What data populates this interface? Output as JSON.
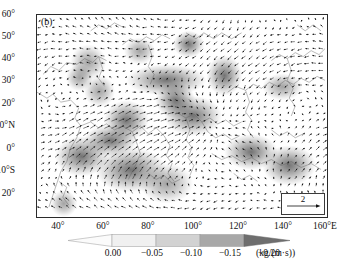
{
  "figure": {
    "panel_label": "(b)",
    "type": "map-vector-shaded"
  },
  "axes": {
    "y_ticks": [
      "60°",
      "50°",
      "40°",
      "30°",
      "20°",
      "10°N",
      "0°",
      "10°S",
      "20°"
    ],
    "x_ticks": [
      "40°",
      "60°",
      "80°",
      "100°",
      "120°",
      "140°",
      "160°E"
    ]
  },
  "vector_key": {
    "value": "2"
  },
  "colorbar": {
    "ticks": [
      "0.00",
      "−0.05",
      "−0.10",
      "−0.15",
      "−0.20"
    ],
    "unit": "(kg/(m·s))"
  },
  "chart_data": {
    "type": "heatmap",
    "title": "(b)",
    "xlabel": "",
    "ylabel": "",
    "xlim": [
      30,
      160
    ],
    "ylim": [
      -25,
      65
    ],
    "x_tick_values": [
      40,
      60,
      80,
      100,
      120,
      140,
      160
    ],
    "x_tick_labels": [
      "40°",
      "60°",
      "80°",
      "100°",
      "120°",
      "140°",
      "160°E"
    ],
    "y_tick_values": [
      60,
      50,
      40,
      30,
      20,
      10,
      0,
      -10,
      -20
    ],
    "y_tick_labels": [
      "60°",
      "50°",
      "40°",
      "30°",
      "20°",
      "10°N",
      "0°",
      "10°S",
      "20°"
    ],
    "grid": false,
    "legend_position": "bottom",
    "colorbar_levels": [
      0.0,
      -0.05,
      -0.1,
      -0.15,
      -0.2
    ],
    "colorbar_unit": "(kg/(m·s))",
    "colorbar_extend": "both",
    "vector_reference": 2,
    "vector_reference_unit": "",
    "shaded_variable": "moisture flux divergence",
    "shaded_blobs": [
      {
        "lon": 53,
        "lat": 44,
        "radius_lon": 8,
        "radius_lat": 8,
        "value": -0.13
      },
      {
        "lon": 49,
        "lat": 37,
        "radius_lon": 6,
        "radius_lat": 6,
        "value": -0.1
      },
      {
        "lon": 58,
        "lat": 31,
        "radius_lon": 7,
        "radius_lat": 7,
        "value": -0.09
      },
      {
        "lon": 76,
        "lat": 49,
        "radius_lon": 7,
        "radius_lat": 6,
        "value": -0.12
      },
      {
        "lon": 98,
        "lat": 52,
        "radius_lon": 7,
        "radius_lat": 6,
        "value": -0.16
      },
      {
        "lon": 88,
        "lat": 36,
        "radius_lon": 18,
        "radius_lat": 7,
        "value": -0.14
      },
      {
        "lon": 92,
        "lat": 27,
        "radius_lon": 9,
        "radius_lat": 8,
        "value": -0.18
      },
      {
        "lon": 100,
        "lat": 20,
        "radius_lon": 13,
        "radius_lat": 9,
        "value": -0.19
      },
      {
        "lon": 114,
        "lat": 38,
        "radius_lon": 8,
        "radius_lat": 9,
        "value": -0.15
      },
      {
        "lon": 70,
        "lat": 18,
        "radius_lon": 10,
        "radius_lat": 9,
        "value": -0.17
      },
      {
        "lon": 63,
        "lat": 9,
        "radius_lon": 12,
        "radius_lat": 7,
        "value": -0.17
      },
      {
        "lon": 50,
        "lat": 2,
        "radius_lon": 12,
        "radius_lat": 9,
        "value": -0.16
      },
      {
        "lon": 72,
        "lat": -4,
        "radius_lon": 16,
        "radius_lat": 10,
        "value": -0.18
      },
      {
        "lon": 88,
        "lat": -10,
        "radius_lon": 12,
        "radius_lat": 9,
        "value": -0.13
      },
      {
        "lon": 126,
        "lat": 4,
        "radius_lon": 12,
        "radius_lat": 8,
        "value": -0.15
      },
      {
        "lon": 143,
        "lat": -2,
        "radius_lon": 12,
        "radius_lat": 9,
        "value": -0.16
      },
      {
        "lon": 140,
        "lat": 33,
        "radius_lon": 9,
        "radius_lat": 6,
        "value": -0.11
      },
      {
        "lon": 42,
        "lat": -19,
        "radius_lon": 6,
        "radius_lat": 6,
        "value": -0.08
      }
    ],
    "vector_field_description": "dense regular grid of small wind/moisture-transport arrows covering the whole domain"
  }
}
